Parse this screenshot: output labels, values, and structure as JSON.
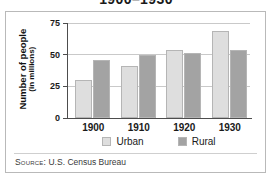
{
  "chart_data": {
    "type": "bar",
    "title": "1900–1930",
    "xlabel": "",
    "ylabel": "Number of people (in millions)",
    "ylabel_lines": [
      "Number of people",
      "(in millions)"
    ],
    "categories": [
      "1900",
      "1910",
      "1920",
      "1930"
    ],
    "series": [
      {
        "name": "Urban",
        "values": [
          30,
          41,
          54,
          69
        ],
        "color": "#dedede"
      },
      {
        "name": "Rural",
        "values": [
          46,
          50,
          51,
          54
        ],
        "color": "#a3a3a3"
      }
    ],
    "ylim": [
      0,
      75
    ],
    "yticks": [
      0,
      25,
      50,
      75
    ],
    "ytick_labels": [
      "0",
      "25",
      "50",
      "75"
    ],
    "grid": "horizontal",
    "legend_position": "bottom-center",
    "annotations": []
  },
  "source": {
    "prefix": "Source:",
    "text": "U.S. Census Bureau"
  },
  "colors": {
    "urban": "#dedede",
    "rural": "#a3a3a3",
    "bar_outline": "#b5b5b5",
    "gridline": "#c9c9c9",
    "axis": "#4d4d4d",
    "frame": "#b9b9b9",
    "text": "#1a1a1a"
  }
}
